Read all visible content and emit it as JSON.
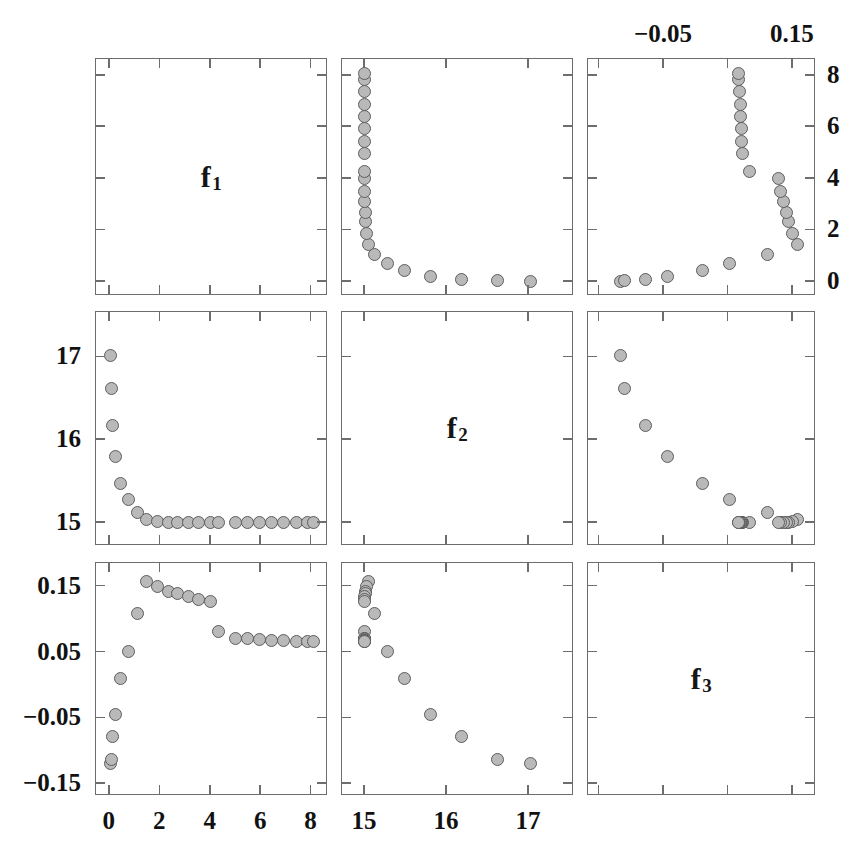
{
  "figure": {
    "type": "scatter-plot-matrix",
    "rows": 3,
    "cols": 3,
    "variables": [
      "f1",
      "f2",
      "f3"
    ],
    "diagonal_labels": [
      {
        "base": "f",
        "sub": "1"
      },
      {
        "base": "f",
        "sub": "2"
      },
      {
        "base": "f",
        "sub": "3"
      }
    ]
  },
  "axes": {
    "f1": {
      "label": "f1",
      "min": -0.55,
      "max": 8.65,
      "ticks": [
        0,
        2,
        4,
        6,
        8
      ],
      "ticklabels": [
        "0",
        "2",
        "4",
        "6",
        "8"
      ]
    },
    "f2": {
      "label": "f2",
      "min": 14.72,
      "max": 17.55,
      "ticks": [
        15,
        16,
        17
      ],
      "ticklabels": [
        "15",
        "16",
        "17"
      ]
    },
    "f3": {
      "label": "f3",
      "min": -0.168,
      "max": 0.186,
      "ticks": [
        -0.15,
        -0.05,
        0.05,
        0.15
      ],
      "ticklabels": [
        "−0.15",
        "−0.05",
        "0.05",
        "0.15"
      ],
      "top_ticklabels": [
        "−0.05",
        "0.15"
      ],
      "top_ticks": [
        -0.05,
        0.15
      ]
    }
  },
  "chart_data": {
    "type": "scatter",
    "title": "",
    "xlabel": "",
    "ylabel": "",
    "variables": [
      "f1",
      "f2",
      "f3"
    ],
    "grid": false,
    "legend": "none",
    "marker": {
      "shape": "circle",
      "fill": "#b9b9b9",
      "edge": "#5d5d5d",
      "size_px": 13
    },
    "points": [
      {
        "f1": 0.02,
        "f2": 17.02,
        "f3": -0.118
      },
      {
        "f1": 0.05,
        "f2": 16.62,
        "f3": -0.112
      },
      {
        "f1": 0.1,
        "f2": 16.18,
        "f3": -0.078
      },
      {
        "f1": 0.22,
        "f2": 15.8,
        "f3": -0.044
      },
      {
        "f1": 0.44,
        "f2": 15.48,
        "f3": 0.01
      },
      {
        "f1": 0.72,
        "f2": 15.28,
        "f3": 0.052
      },
      {
        "f1": 1.08,
        "f2": 15.12,
        "f3": 0.11
      },
      {
        "f1": 1.44,
        "f2": 15.04,
        "f3": 0.158
      },
      {
        "f1": 1.88,
        "f2": 15.02,
        "f3": 0.15
      },
      {
        "f1": 2.34,
        "f2": 15.01,
        "f3": 0.143
      },
      {
        "f1": 2.68,
        "f2": 15.01,
        "f3": 0.14
      },
      {
        "f1": 3.1,
        "f2": 15.0,
        "f3": 0.135
      },
      {
        "f1": 3.52,
        "f2": 15.0,
        "f3": 0.131
      },
      {
        "f1": 4.0,
        "f2": 15.0,
        "f3": 0.127
      },
      {
        "f1": 4.3,
        "f2": 15.0,
        "f3": 0.082
      },
      {
        "f1": 5.0,
        "f2": 15.0,
        "f3": 0.072
      },
      {
        "f1": 5.45,
        "f2": 15.0,
        "f3": 0.071
      },
      {
        "f1": 5.95,
        "f2": 15.0,
        "f3": 0.07
      },
      {
        "f1": 6.42,
        "f2": 15.0,
        "f3": 0.069
      },
      {
        "f1": 6.9,
        "f2": 15.0,
        "f3": 0.068
      },
      {
        "f1": 7.4,
        "f2": 15.0,
        "f3": 0.067
      },
      {
        "f1": 7.85,
        "f2": 15.0,
        "f3": 0.066
      },
      {
        "f1": 8.08,
        "f2": 15.0,
        "f3": 0.066
      }
    ]
  }
}
